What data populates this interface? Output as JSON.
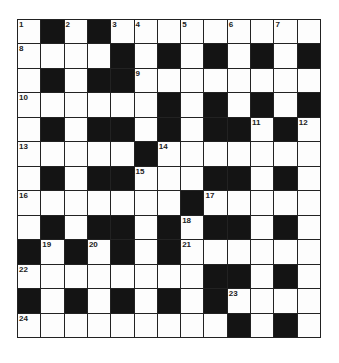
{
  "puzzle": {
    "rows": 13,
    "cols": 13,
    "colors": {
      "black_cell": "#141414",
      "white_cell": "#fdfdfd",
      "grid_line": "#222222"
    },
    "grid": [
      [
        "1",
        "#",
        "2",
        "#",
        "3",
        "4",
        "",
        "5",
        "",
        "6",
        "",
        "7",
        ""
      ],
      [
        "8",
        "",
        "",
        "",
        "#",
        "",
        "#",
        "",
        "#",
        "",
        "#",
        "",
        "#"
      ],
      [
        "",
        "#",
        "",
        "#",
        "#",
        "9",
        "",
        "",
        "",
        "",
        "",
        "",
        ""
      ],
      [
        "10",
        "",
        "",
        "",
        "",
        "",
        "#",
        "",
        "#",
        "",
        "#",
        "",
        "#"
      ],
      [
        "",
        "#",
        "",
        "#",
        "#",
        "",
        "#",
        "",
        "#",
        "#",
        "11",
        "#",
        "12"
      ],
      [
        "13",
        "",
        "",
        "",
        "",
        "#",
        "14",
        "",
        "",
        "",
        "",
        "",
        ""
      ],
      [
        "",
        "#",
        "",
        "#",
        "#",
        "15",
        "",
        "",
        "#",
        "#",
        "",
        "#",
        ""
      ],
      [
        "16",
        "",
        "",
        "",
        "",
        "",
        "",
        "#",
        "17",
        "",
        "",
        "",
        ""
      ],
      [
        "",
        "#",
        "",
        "#",
        "#",
        "",
        "#",
        "18",
        "#",
        "#",
        "",
        "#",
        ""
      ],
      [
        "#",
        "19",
        "#",
        "20",
        "#",
        "",
        "#",
        "21",
        "",
        "",
        "",
        "",
        ""
      ],
      [
        "22",
        "",
        "",
        "",
        "",
        "",
        "",
        "",
        "#",
        "#",
        "",
        "#",
        ""
      ],
      [
        "#",
        "",
        "#",
        "",
        "#",
        "",
        "#",
        "",
        "#",
        "23",
        "",
        "",
        ""
      ],
      [
        "24",
        "",
        "",
        "",
        "",
        "",
        "",
        "",
        "",
        "#",
        "",
        "#",
        ""
      ]
    ]
  }
}
